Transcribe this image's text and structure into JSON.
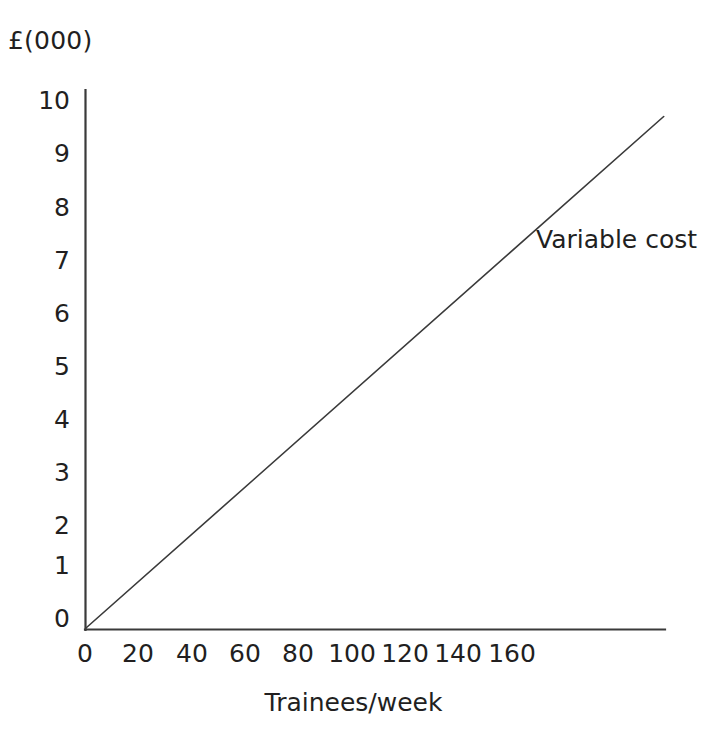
{
  "chart_data": {
    "type": "line",
    "title": "",
    "subtitle": "",
    "xlabel": "Trainees/week",
    "ylabel": "£(000)",
    "ylabel_position": "top-left",
    "xlim": [
      0,
      218
    ],
    "ylim": [
      0,
      10.2
    ],
    "xticks": [
      0,
      20,
      40,
      60,
      80,
      100,
      120,
      140,
      160
    ],
    "xtick_labels": [
      "0",
      "20",
      "40",
      "60",
      "80",
      "100",
      "120",
      "140",
      "160"
    ],
    "yticks": [
      0,
      1,
      2,
      3,
      4,
      5,
      6,
      7,
      8,
      9,
      10
    ],
    "ytick_labels": [
      "0",
      "1",
      "2",
      "3",
      "4",
      "5",
      "6",
      "7",
      "8",
      "9",
      "10"
    ],
    "grid": false,
    "legend": "none",
    "series": [
      {
        "name": "Variable cost",
        "annotation": "Variable cost",
        "color": "#3a3a3a",
        "line_width": 1.6,
        "x": [
          0,
          218
        ],
        "y": [
          0,
          9.65
        ],
        "points": [
          {
            "x": 0,
            "y": 0
          },
          {
            "x": 20,
            "y": 0.89
          },
          {
            "x": 40,
            "y": 1.77
          },
          {
            "x": 60,
            "y": 2.66
          },
          {
            "x": 80,
            "y": 3.54
          },
          {
            "x": 100,
            "y": 4.43
          },
          {
            "x": 120,
            "y": 5.31
          },
          {
            "x": 140,
            "y": 6.2
          },
          {
            "x": 160,
            "y": 7.08
          },
          {
            "x": 180,
            "y": 7.97
          },
          {
            "x": 200,
            "y": 8.85
          },
          {
            "x": 218,
            "y": 9.65
          }
        ],
        "slope_per_trainee": 0.0443,
        "intercept": 0
      }
    ],
    "annotations": [
      {
        "text": "Variable cost",
        "x": 160,
        "y": 7.35
      }
    ],
    "axis_color": "#3a3a3a",
    "background": "#ffffff"
  }
}
